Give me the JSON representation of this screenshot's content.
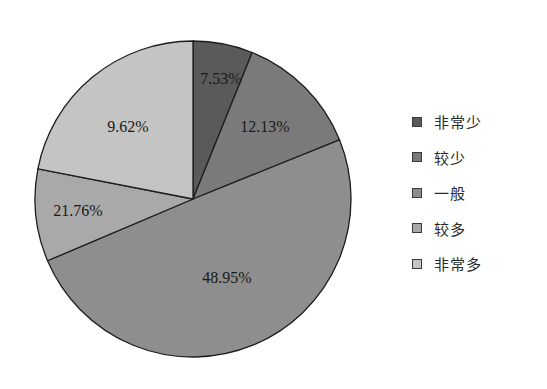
{
  "chart_data": {
    "type": "pie",
    "title": "",
    "start_angle_deg": 0,
    "direction": "clockwise",
    "legend_position": "right",
    "categories": [
      "非常少",
      "较少",
      "一般",
      "较多",
      "非常多"
    ],
    "values": [
      7.53,
      12.13,
      48.95,
      21.76,
      9.62
    ],
    "value_labels": [
      "7.53%",
      "12.13%",
      "48.95%",
      "21.76%",
      "9.62%"
    ],
    "colors": [
      "#5a5a5a",
      "#7a7a7a",
      "#8e8e8e",
      "#a9a9a9",
      "#c4c4c4"
    ],
    "visual_slice_degrees": [
      22,
      46,
      179,
      34,
      79
    ]
  },
  "legend": {
    "items": [
      {
        "label": "非常少",
        "color": "#5a5a5a"
      },
      {
        "label": "较少",
        "color": "#7a7a7a"
      },
      {
        "label": "一般",
        "color": "#8e8e8e"
      },
      {
        "label": "较多",
        "color": "#a9a9a9"
      },
      {
        "label": "非常多",
        "color": "#c4c4c4"
      }
    ]
  },
  "labels": {
    "s0": "7.53%",
    "s1": "12.13%",
    "s2": "48.95%",
    "s3": "21.76%",
    "s4": "9.62%"
  }
}
